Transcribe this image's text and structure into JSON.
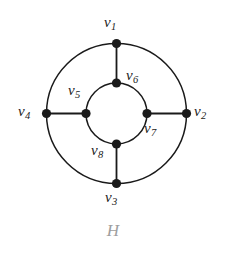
{
  "figure": {
    "caption": "H",
    "caption_color": "#9e9e9e",
    "background_color": "#ffffff",
    "stroke_color": "#1a1a1a",
    "vertex_fill": "#1a1a1a"
  },
  "graph": {
    "name": "H",
    "center": {
      "x": 116.5,
      "y": 113.5
    },
    "outer_radius": 70,
    "inner_radius": 30.5,
    "vertex_radius": 4.6,
    "vertices": [
      {
        "id": "v1",
        "letter": "v",
        "index": "1",
        "ring": "outer",
        "angle_deg": 270,
        "x": 116.5,
        "y": 43.5,
        "label_x": 104,
        "label_y": 15
      },
      {
        "id": "v2",
        "letter": "v",
        "index": "2",
        "ring": "outer",
        "angle_deg": 0,
        "x": 186.5,
        "y": 113.5,
        "label_x": 194,
        "label_y": 104
      },
      {
        "id": "v3",
        "letter": "v",
        "index": "3",
        "ring": "outer",
        "angle_deg": 90,
        "x": 116.5,
        "y": 183.5,
        "label_x": 105,
        "label_y": 190
      },
      {
        "id": "v4",
        "letter": "v",
        "index": "4",
        "ring": "outer",
        "angle_deg": 180,
        "x": 46.5,
        "y": 113.5,
        "label_x": 18,
        "label_y": 104
      },
      {
        "id": "v5",
        "letter": "v",
        "index": "5",
        "ring": "inner",
        "angle_deg": 180,
        "x": 86,
        "y": 113.5,
        "label_x": 68,
        "label_y": 83
      },
      {
        "id": "v6",
        "letter": "v",
        "index": "6",
        "ring": "inner",
        "angle_deg": 270,
        "x": 116.5,
        "y": 83,
        "label_x": 126,
        "label_y": 68
      },
      {
        "id": "v7",
        "letter": "v",
        "index": "7",
        "ring": "inner",
        "angle_deg": 0,
        "x": 147,
        "y": 113.5,
        "label_x": 144,
        "label_y": 121
      },
      {
        "id": "v8",
        "letter": "v",
        "index": "8",
        "ring": "inner",
        "angle_deg": 90,
        "x": 116.5,
        "y": 144,
        "label_x": 91,
        "label_y": 143
      }
    ],
    "spoke_edges": [
      {
        "from": "v1",
        "to": "v6"
      },
      {
        "from": "v2",
        "to": "v7"
      },
      {
        "from": "v3",
        "to": "v8"
      },
      {
        "from": "v4",
        "to": "v5"
      }
    ],
    "cycle_outer": [
      "v1",
      "v2",
      "v3",
      "v4"
    ],
    "cycle_inner": [
      "v6",
      "v7",
      "v8",
      "v5"
    ]
  }
}
